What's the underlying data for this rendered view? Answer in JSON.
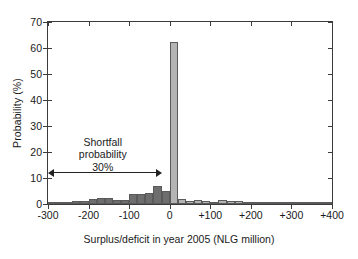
{
  "chart_data": {
    "type": "bar",
    "title": "",
    "subtitle": "",
    "xlabel": "Surplus/deficit in year 2005 (NLG million)",
    "ylabel": "Probability (%)",
    "xlim": [
      -300,
      400
    ],
    "ylim": [
      0,
      70
    ],
    "xticks": [
      "-300",
      "-200",
      "-100",
      "0",
      "+100",
      "+200",
      "+300",
      "+400"
    ],
    "xtick_values": [
      -300,
      -200,
      -100,
      0,
      100,
      200,
      300,
      400
    ],
    "yticks": [
      "0",
      "10",
      "20",
      "30",
      "40",
      "50",
      "60",
      "70"
    ],
    "ytick_values": [
      0,
      10,
      20,
      30,
      40,
      50,
      60,
      70
    ],
    "grid": false,
    "legend": "none",
    "bin_width": 20,
    "bar_color_negative": "#6e6e6e",
    "bar_color_positive": "#b4b4b4",
    "bar_edge_color": "#5a5a5a",
    "axis_color": "#3c3c3c",
    "background": "#ffffff",
    "bins": [
      {
        "x0": -300,
        "x1": -280,
        "value": 0.8
      },
      {
        "x0": -280,
        "x1": -260,
        "value": 0.8
      },
      {
        "x0": -260,
        "x1": -240,
        "value": 0.8
      },
      {
        "x0": -240,
        "x1": -220,
        "value": 1.0
      },
      {
        "x0": -220,
        "x1": -200,
        "value": 1.2
      },
      {
        "x0": -200,
        "x1": -180,
        "value": 2.0
      },
      {
        "x0": -180,
        "x1": -160,
        "value": 2.3
      },
      {
        "x0": -160,
        "x1": -140,
        "value": 2.3
      },
      {
        "x0": -140,
        "x1": -120,
        "value": 1.6
      },
      {
        "x0": -120,
        "x1": -100,
        "value": 1.6
      },
      {
        "x0": -100,
        "x1": -80,
        "value": 3.8
      },
      {
        "x0": -80,
        "x1": -60,
        "value": 3.9
      },
      {
        "x0": -60,
        "x1": -40,
        "value": 4.2
      },
      {
        "x0": -40,
        "x1": -20,
        "value": 7.0
      },
      {
        "x0": -20,
        "x1": 0,
        "value": 5.0
      },
      {
        "x0": 0,
        "x1": 20,
        "value": 62.2
      },
      {
        "x0": 20,
        "x1": 40,
        "value": 2.0
      },
      {
        "x0": 40,
        "x1": 60,
        "value": 1.2
      },
      {
        "x0": 60,
        "x1": 80,
        "value": 1.4
      },
      {
        "x0": 80,
        "x1": 100,
        "value": 1.2
      },
      {
        "x0": 100,
        "x1": 120,
        "value": 0.8
      },
      {
        "x0": 120,
        "x1": 140,
        "value": 1.5
      },
      {
        "x0": 140,
        "x1": 160,
        "value": 1.2
      },
      {
        "x0": 160,
        "x1": 180,
        "value": 1.0
      },
      {
        "x0": 180,
        "x1": 200,
        "value": 0.7
      },
      {
        "x0": 200,
        "x1": 220,
        "value": 0.6
      },
      {
        "x0": 220,
        "x1": 240,
        "value": 0.6
      },
      {
        "x0": 240,
        "x1": 260,
        "value": 0.9
      },
      {
        "x0": 260,
        "x1": 280,
        "value": 0.8
      },
      {
        "x0": 280,
        "x1": 300,
        "value": 0.6
      },
      {
        "x0": 300,
        "x1": 320,
        "value": 0.3
      },
      {
        "x0": 320,
        "x1": 340,
        "value": 0.3
      },
      {
        "x0": 340,
        "x1": 360,
        "value": 0.8
      },
      {
        "x0": 360,
        "x1": 380,
        "value": 0.8
      },
      {
        "x0": 380,
        "x1": 400,
        "value": 0.8
      }
    ],
    "annotations": [
      {
        "name": "shortfall-annotation",
        "line1": "Shortfall",
        "line2": "probability",
        "line3": "30%",
        "text_x": -165,
        "text_y": 24,
        "arrow_x_start": -300,
        "arrow_x_end": -20,
        "arrow_y": 12,
        "arrow_style": "double-headed"
      }
    ]
  }
}
